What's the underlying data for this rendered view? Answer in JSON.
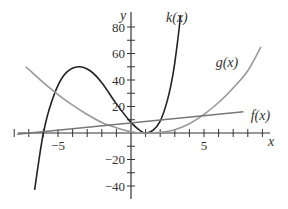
{
  "chart_data": {
    "type": "line",
    "title": "",
    "xlabel": "x",
    "ylabel": "y",
    "xlim": [
      -8.5,
      9.5
    ],
    "ylim": [
      -45,
      90
    ],
    "x_ticks": [
      -8,
      -7,
      -6,
      -5,
      -4,
      -3,
      -2,
      -1,
      1,
      2,
      3,
      4,
      5,
      6,
      7,
      8,
      9
    ],
    "x_tick_labels": [
      {
        "value": -5,
        "label": "−5"
      },
      {
        "value": 5,
        "label": "5"
      }
    ],
    "y_ticks": [
      -40,
      -30,
      -20,
      -10,
      10,
      20,
      30,
      40,
      50,
      60,
      70,
      80
    ],
    "y_tick_labels": [
      {
        "value": 80,
        "label": "80"
      },
      {
        "value": 60,
        "label": "60"
      },
      {
        "value": 40,
        "label": "40"
      },
      {
        "value": 20,
        "label": "20"
      },
      {
        "value": -20,
        "label": "−20"
      },
      {
        "value": -40,
        "label": "−40"
      }
    ],
    "grid": false,
    "series": [
      {
        "name": "k(x)",
        "color": "#222222",
        "label_pos": {
          "x": 2.4,
          "y": 84
        },
        "points": [
          [
            -6.6,
            -43
          ],
          [
            -6.3,
            -20
          ],
          [
            -6.0,
            0
          ],
          [
            -5.6,
            18
          ],
          [
            -5.0,
            36
          ],
          [
            -4.4,
            46
          ],
          [
            -3.6,
            50
          ],
          [
            -2.8,
            47
          ],
          [
            -2.0,
            38
          ],
          [
            -1.0,
            22
          ],
          [
            0,
            8
          ],
          [
            0.6,
            2
          ],
          [
            1.0,
            0
          ],
          [
            1.5,
            2
          ],
          [
            2.0,
            9
          ],
          [
            2.5,
            25
          ],
          [
            2.9,
            46
          ],
          [
            3.2,
            70
          ],
          [
            3.4,
            89
          ]
        ]
      },
      {
        "name": "g(x)",
        "color": "#999999",
        "label_pos": {
          "x": 5.8,
          "y": 50
        },
        "points": [
          [
            -7.2,
            50
          ],
          [
            -6,
            38
          ],
          [
            -5,
            29
          ],
          [
            -4,
            21
          ],
          [
            -3,
            14
          ],
          [
            -2,
            8
          ],
          [
            -1,
            4
          ],
          [
            0,
            1
          ],
          [
            1,
            0
          ],
          [
            2,
            0.5
          ],
          [
            3,
            2.5
          ],
          [
            4,
            7
          ],
          [
            5,
            14
          ],
          [
            6,
            23
          ],
          [
            7,
            34
          ],
          [
            8,
            47
          ],
          [
            8.9,
            65
          ]
        ]
      },
      {
        "name": "f(x)",
        "color": "#777777",
        "label_pos": {
          "x": 8.2,
          "y": 10
        },
        "points": [
          [
            -7.8,
            -1
          ],
          [
            7.7,
            16
          ]
        ]
      }
    ]
  }
}
